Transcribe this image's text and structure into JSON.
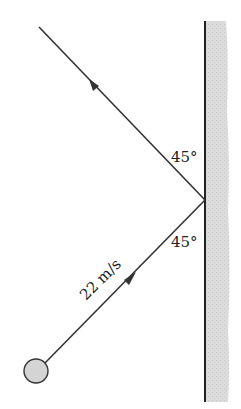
{
  "diagram": {
    "labels": {
      "angle_upper": "45°",
      "angle_lower": "45°",
      "speed": "22 m/s"
    },
    "colors": {
      "line": "#333333",
      "wall_fill": "#d9d9d9",
      "ball_fill": "#d4d4d4",
      "text": "#222222"
    },
    "elements": {
      "wall": "vertical-wall",
      "ball": "ball",
      "incoming_path": "incident-trajectory",
      "outgoing_path": "reflected-trajectory"
    }
  }
}
